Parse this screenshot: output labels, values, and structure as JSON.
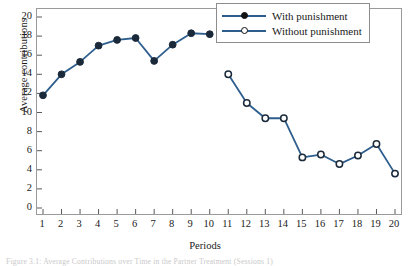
{
  "chart_data": {
    "type": "line",
    "title": "",
    "xlabel": "Periods",
    "ylabel": "Average contributions",
    "xlim": [
      1,
      20
    ],
    "ylim": [
      0,
      20
    ],
    "xticks": [
      1,
      2,
      3,
      4,
      5,
      6,
      7,
      8,
      9,
      10,
      11,
      12,
      13,
      14,
      15,
      16,
      17,
      18,
      19,
      20
    ],
    "yticks": [
      0,
      2,
      4,
      6,
      8,
      10,
      12,
      14,
      16,
      18,
      20
    ],
    "grid": false,
    "legend_position": "top-right",
    "series": [
      {
        "name": "With punishment",
        "marker": "filled-circle",
        "color": "#2e5e8e",
        "x": [
          1,
          2,
          3,
          4,
          5,
          6,
          7,
          8,
          9,
          10
        ],
        "values": [
          11.8,
          14.0,
          15.3,
          17.0,
          17.6,
          17.8,
          15.4,
          17.1,
          18.3,
          18.2
        ]
      },
      {
        "name": "Without punishment",
        "marker": "open-circle",
        "color": "#2e5e8e",
        "x": [
          11,
          12,
          13,
          14,
          15,
          16,
          17,
          18,
          19,
          20
        ],
        "values": [
          14.0,
          11.0,
          9.4,
          9.4,
          5.3,
          5.6,
          4.6,
          5.5,
          6.7,
          3.6
        ]
      }
    ]
  },
  "legend": {
    "entries": [
      {
        "label": "With punishment"
      },
      {
        "label": "Without punishment"
      }
    ]
  },
  "caption": "Figure 3.1: Average Contributions over Time in the Partner Treatment (Sessions 1)"
}
